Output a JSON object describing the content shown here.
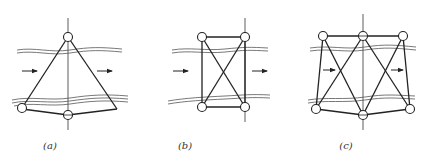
{
  "figure": {
    "panels": [
      {
        "id": "a",
        "label": "(a)",
        "label_x": 50,
        "shape": "triangle-frame",
        "description": "Triangular frame with apex node above the upper band, two bottom nodes; vertical centerline; flow arrows left to right"
      },
      {
        "id": "b",
        "label": "(b)",
        "label_x": 184,
        "shape": "rectangle-cross-braced",
        "description": "Rectangular frame with 4 corner nodes and X cross bracing; vertical centerline at right edge; flow arrows left to right"
      },
      {
        "id": "c",
        "label": "(c)",
        "label_x": 344,
        "shape": "double-cross-braced-frame",
        "description": "Frame with 3 top nodes and 3 bottom nodes, two X braces; vertical centerline through middle; flow arrows left to right"
      }
    ],
    "colors": {
      "stroke": "#222222",
      "band": "#555555",
      "centerline": "#333333"
    }
  }
}
